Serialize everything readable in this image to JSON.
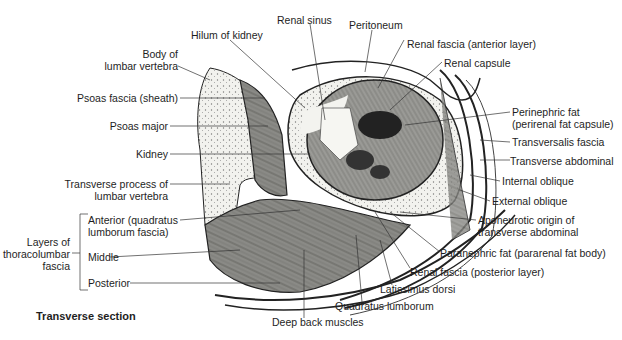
{
  "figure": {
    "caption": "Transverse section",
    "labels": {
      "renal_sinus": "Renal sinus",
      "hilum": "Hilum of kidney",
      "peritoneum": "Peritoneum",
      "renal_fascia_anterior": "Renal fascia (anterior layer)",
      "renal_capsule": "Renal capsule",
      "body_vertebra_1": "Body of",
      "body_vertebra_2": "lumbar vertebra",
      "psoas_fascia": "Psoas fascia (sheath)",
      "psoas_major": "Psoas major",
      "kidney": "Kidney",
      "perinephric_1": "Perinephric fat",
      "perinephric_2": "(perirenal fat capsule)",
      "transversalis": "Transversalis fascia",
      "transverse_abdominal": "Transverse abdominal",
      "internal_oblique": "Internal oblique",
      "external_oblique": "External oblique",
      "transverse_process_1": "Transverse process of",
      "transverse_process_2": "lumbar vertebra",
      "aponeurotic_1": "Aponeurotic origin of",
      "aponeurotic_2": "transverse abdominal",
      "layers_1": "Layers of",
      "layers_2": "thoracolumbar",
      "layers_3": "fascia",
      "anterior_1": "Anterior (quadratus",
      "anterior_2": "lumborum fascia)",
      "middle": "Middle",
      "posterior": "Posterior",
      "paranephric": "Paranephric fat (pararenal fat body)",
      "renal_fascia_posterior": "Renal fascia (posterior layer)",
      "latissimus": "Latissimus dorsi",
      "quadratus": "Quadratus lumborum",
      "deep_back": "Deep back muscles"
    }
  }
}
